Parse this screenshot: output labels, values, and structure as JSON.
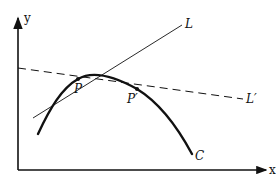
{
  "diagram": {
    "axes": {
      "x_label": "x",
      "y_label": "y"
    },
    "curve": {
      "label": "C"
    },
    "tangent_line": {
      "label": "L"
    },
    "secant_line": {
      "label": "L′",
      "style": "dashed"
    },
    "points": [
      {
        "label": "P"
      },
      {
        "label": "P′"
      }
    ],
    "colors": {
      "ink": "#111111",
      "background": "#ffffff"
    }
  }
}
